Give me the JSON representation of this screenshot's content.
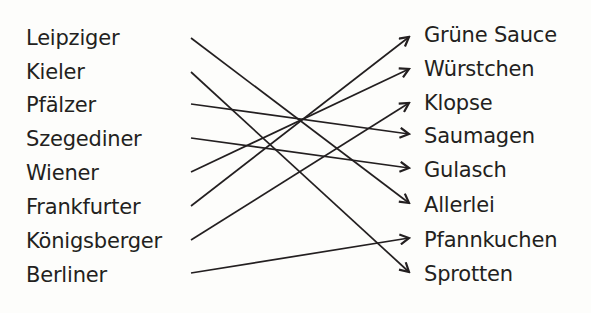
{
  "left_items": [
    "Leipziger",
    "Kieler",
    "Pfälzer",
    "Szegediner",
    "Wiener",
    "Frankfurter",
    "Königsberger",
    "Berliner"
  ],
  "right_items": [
    "Grüne Sauce",
    "Würstchen",
    "Klopse",
    "Saumagen",
    "Gulasch",
    "Allerlei",
    "Pfannkuchen",
    "Sprotten"
  ],
  "connections": [
    {
      "from": "Leipziger",
      "to": "Allerlei"
    },
    {
      "from": "Kieler",
      "to": "Sprotten"
    },
    {
      "from": "Pfälzer",
      "to": "Saumagen"
    },
    {
      "from": "Szegediner",
      "to": "Gulasch"
    },
    {
      "from": "Wiener",
      "to": "Würstchen"
    },
    {
      "from": "Frankfurter",
      "to": "Grüne Sauce"
    },
    {
      "from": "Königsberger",
      "to": "Klopse"
    },
    {
      "from": "Berliner",
      "to": "Pfannkuchen"
    }
  ],
  "colors": {
    "text": "#231f20",
    "line": "#231f20",
    "background": "#fdfdfb"
  }
}
